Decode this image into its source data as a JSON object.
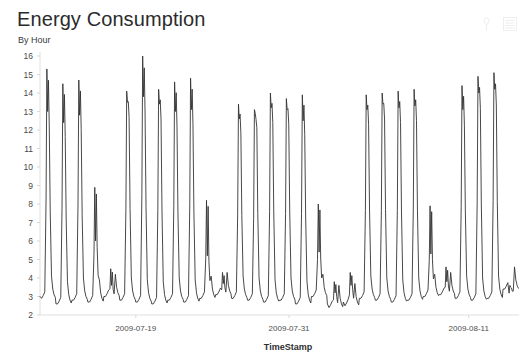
{
  "panel": {
    "title": "Energy Consumption",
    "subtitle": "By Hour",
    "background_color": "#ffffff",
    "actions": [
      {
        "name": "pin-icon",
        "label": "Pin"
      },
      {
        "name": "menu-icon",
        "label": "Menu"
      }
    ]
  },
  "chart_data": {
    "type": "line",
    "title": "Energy Consumption",
    "subtitle": "By Hour",
    "xlabel": "TimeStamp",
    "ylabel": "",
    "ylim": [
      2,
      16
    ],
    "grid": false,
    "legend": null,
    "line_color": "#333333",
    "y_ticks": [
      2,
      3,
      4,
      5,
      6,
      7,
      8,
      9,
      10,
      11,
      12,
      13,
      14,
      15,
      16
    ],
    "y_tick_labels": [
      "2",
      "3",
      "4",
      "5",
      "6",
      "7",
      "8",
      "9",
      "10",
      "11",
      "12",
      "13",
      "14",
      "15",
      "16"
    ],
    "x_tick_labels": [
      "2009-07-19",
      "2009-07-31",
      "2009-08-11"
    ],
    "x_tick_positions": [
      0.2,
      0.52,
      0.895
    ],
    "x_range_start": "2009-07-16",
    "x_range_end": "2009-08-12",
    "series": [
      {
        "name": "Energy Consumption",
        "color": "#333333",
        "cycles": [
          {
            "base_start": 3.0,
            "trough": 2.9,
            "peak": 15.3,
            "secondary": 13.0
          },
          {
            "base_start": 2.6,
            "trough": 2.6,
            "peak": 14.5,
            "secondary": 12.4
          },
          {
            "base_start": 2.8,
            "trough": 2.8,
            "peak": 14.7,
            "secondary": 12.8
          },
          {
            "base_start": 2.7,
            "trough": 2.7,
            "peak": 8.9,
            "secondary": 6.0
          },
          {
            "base_start": 3.0,
            "trough": 3.0,
            "peak": 4.5,
            "secondary": 3.6
          },
          {
            "base_start": 2.8,
            "trough": 2.8,
            "peak": 14.1,
            "secondary": 13.5
          },
          {
            "base_start": 2.7,
            "trough": 2.7,
            "peak": 16.0,
            "secondary": 13.8
          },
          {
            "base_start": 2.6,
            "trough": 2.6,
            "peak": 14.2,
            "secondary": 13.4
          },
          {
            "base_start": 2.8,
            "trough": 2.8,
            "peak": 14.6,
            "secondary": 13.0
          },
          {
            "base_start": 2.7,
            "trough": 2.7,
            "peak": 14.8,
            "secondary": 13.1
          },
          {
            "base_start": 2.9,
            "trough": 2.9,
            "peak": 8.2,
            "secondary": 5.2
          },
          {
            "base_start": 3.1,
            "trough": 3.1,
            "peak": 4.3,
            "secondary": 3.7
          },
          {
            "base_start": 2.9,
            "trough": 2.9,
            "peak": 13.4,
            "secondary": 12.6
          },
          {
            "base_start": 2.8,
            "trough": 2.8,
            "peak": 13.1,
            "secondary": 12.9
          },
          {
            "base_start": 2.7,
            "trough": 2.7,
            "peak": 14.0,
            "secondary": 13.2
          },
          {
            "base_start": 2.8,
            "trough": 2.8,
            "peak": 13.7,
            "secondary": 13.1
          },
          {
            "base_start": 2.6,
            "trough": 2.6,
            "peak": 13.9,
            "secondary": 12.5
          },
          {
            "base_start": 3.0,
            "trough": 3.0,
            "peak": 8.0,
            "secondary": 5.4
          },
          {
            "base_start": 2.6,
            "trough": 2.4,
            "peak": 3.8,
            "secondary": 3.2
          },
          {
            "base_start": 2.7,
            "trough": 2.5,
            "peak": 4.3,
            "secondary": 3.6
          },
          {
            "base_start": 2.9,
            "trough": 2.9,
            "peak": 13.9,
            "secondary": 13.1
          },
          {
            "base_start": 2.8,
            "trough": 2.8,
            "peak": 14.0,
            "secondary": 13.4
          },
          {
            "base_start": 2.7,
            "trough": 2.7,
            "peak": 14.1,
            "secondary": 13.2
          },
          {
            "base_start": 2.8,
            "trough": 2.8,
            "peak": 14.2,
            "secondary": 13.3
          },
          {
            "base_start": 3.0,
            "trough": 3.0,
            "peak": 7.9,
            "secondary": 5.3
          },
          {
            "base_start": 3.1,
            "trough": 3.1,
            "peak": 4.6,
            "secondary": 3.8
          },
          {
            "base_start": 2.9,
            "trough": 2.9,
            "peak": 14.4,
            "secondary": 13.1
          },
          {
            "base_start": 2.8,
            "trough": 2.8,
            "peak": 14.9,
            "secondary": 14.0
          },
          {
            "base_start": 2.9,
            "trough": 2.9,
            "peak": 15.1,
            "secondary": 14.2
          },
          {
            "base_start": 3.4,
            "trough": 3.4,
            "peak": 3.6,
            "secondary": 3.5
          }
        ]
      }
    ]
  }
}
